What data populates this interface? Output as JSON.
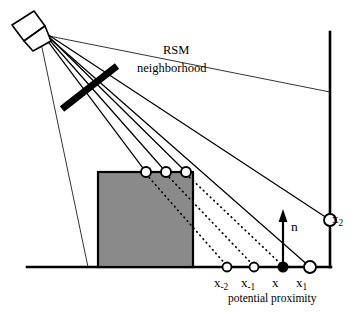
{
  "figure": {
    "background_color": "#ffffff",
    "line_color": "#000000",
    "box_fill_color": "#8a8a8a",
    "box_stroke_color": "#000000",
    "marker_fill_color": "#ffffff",
    "marker_selected_fill_color": "#000000"
  },
  "labels": {
    "rsm": "RSM",
    "neighborhood": "neighborhood",
    "normal": "n",
    "x_minus_2": "x",
    "x_minus_2_sub": "-2",
    "x_minus_1": "x",
    "x_minus_1_sub": "-1",
    "x_center": "x",
    "x_plus_1": "x",
    "x_plus_1_sub": "1",
    "x_plus_2": "x",
    "x_plus_2_sub": "2",
    "potential_proximity": "potential proximity"
  },
  "geometry": {
    "light_source": {
      "x": 42,
      "y": 33
    },
    "ground_line": {
      "x1": 27,
      "y1": 267,
      "x2": 330,
      "y2": 267
    },
    "right_wall": {
      "x1": 330,
      "y1": 32,
      "x2": 330,
      "y2": 267
    },
    "occluder_box": {
      "x": 98,
      "y": 172,
      "width": 95,
      "height": 95
    },
    "rsm_bar": {
      "x1": 62,
      "y1": 108,
      "x2": 116,
      "y2": 67,
      "thickness": 7
    },
    "normal_arrow": {
      "x": 283,
      "y_base": 266,
      "y_tip": 212
    },
    "box_top_markers": [
      {
        "x": 146,
        "y": 172,
        "r": 5
      },
      {
        "x": 166,
        "y": 172,
        "r": 5
      },
      {
        "x": 186,
        "y": 172,
        "r": 5
      }
    ],
    "ground_markers": [
      {
        "name": "x_minus_2",
        "x": 227,
        "y": 267,
        "r": 4.5,
        "filled": false
      },
      {
        "name": "x_minus_1",
        "x": 254,
        "y": 267,
        "r": 4.5,
        "filled": false
      },
      {
        "name": "x_center",
        "x": 283,
        "y": 267,
        "r": 4.5,
        "filled": true
      },
      {
        "name": "x_plus_1",
        "x": 310,
        "y": 267,
        "r": 6.0,
        "filled": false
      }
    ],
    "wall_markers": [
      {
        "name": "x_plus_2",
        "x": 330,
        "y": 220,
        "r": 6.0,
        "filled": false
      }
    ],
    "shadow_boundary_rays": [
      {
        "from": {
          "x": 42,
          "y": 33
        },
        "to": {
          "x": 330,
          "y": 92
        }
      },
      {
        "from": {
          "x": 42,
          "y": 33
        },
        "to": {
          "x": 88,
          "y": 267
        }
      }
    ],
    "sample_rays": [
      {
        "from": {
          "x": 42,
          "y": 33
        },
        "to": {
          "x": 146,
          "y": 172
        }
      },
      {
        "from": {
          "x": 42,
          "y": 33
        },
        "to": {
          "x": 166,
          "y": 172
        }
      },
      {
        "from": {
          "x": 42,
          "y": 33
        },
        "to": {
          "x": 186,
          "y": 172
        }
      },
      {
        "from": {
          "x": 42,
          "y": 33
        },
        "to": {
          "x": 330,
          "y": 220
        }
      },
      {
        "from": {
          "x": 42,
          "y": 33
        },
        "to": {
          "x": 310,
          "y": 267
        }
      }
    ],
    "proximity_dotted_lines": [
      {
        "from": {
          "x": 146,
          "y": 172
        },
        "to": {
          "x": 227,
          "y": 267
        }
      },
      {
        "from": {
          "x": 166,
          "y": 172
        },
        "to": {
          "x": 254,
          "y": 267
        }
      },
      {
        "from": {
          "x": 186,
          "y": 172
        },
        "to": {
          "x": 283,
          "y": 267
        }
      }
    ]
  }
}
